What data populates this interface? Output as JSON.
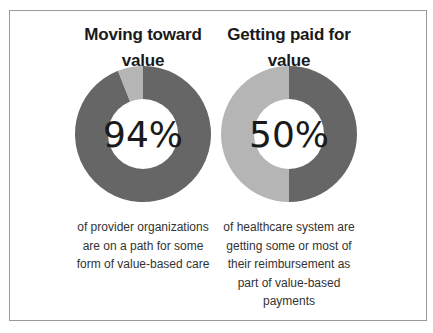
{
  "colors": {
    "dark": "#666666",
    "light": "#b5b5b5",
    "border": "#9a9a9a"
  },
  "panels": [
    {
      "title_line1": "Moving toward",
      "title_line2": "value",
      "percent_label": "94%",
      "caption_lines": [
        "of provider organizations",
        "are on a path for some",
        "form of value-based care"
      ]
    },
    {
      "title_line1": "Getting paid for",
      "title_line2": "value",
      "percent_label": "50%",
      "caption_lines": [
        "of healthcare system are",
        "getting some or most of",
        "their reimbursement as",
        "part of value-based",
        "payments"
      ]
    }
  ],
  "chart_data": [
    {
      "type": "pie",
      "subtype": "donut",
      "title": "Moving toward value",
      "categories": [
        "On a path for value-based care",
        "Other"
      ],
      "values": [
        94,
        6
      ],
      "center_label": "94%",
      "annotation": "of provider organizations are on a path for some form of value-based care"
    },
    {
      "type": "pie",
      "subtype": "donut",
      "title": "Getting paid for value",
      "categories": [
        "Getting some or most reimbursement as value-based payments",
        "Other"
      ],
      "values": [
        50,
        50
      ],
      "center_label": "50%",
      "annotation": "of healthcare system are getting some or most of their reimbursement as part of value-based payments"
    }
  ]
}
